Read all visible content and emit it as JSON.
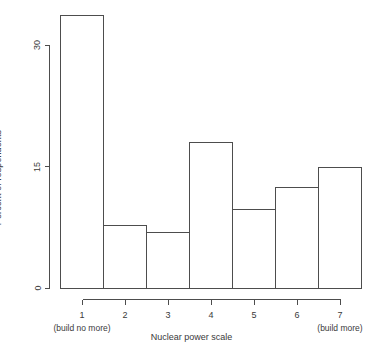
{
  "chart_data": {
    "type": "bar",
    "title": "",
    "subtitle": "",
    "xlabel": "Nuclear power scale",
    "ylabel": "Percent of respondents",
    "categories": [
      "1",
      "2",
      "3",
      "4",
      "5",
      "6",
      "7"
    ],
    "values": [
      33.7,
      7.8,
      6.9,
      18.0,
      9.8,
      12.5,
      15.0
    ],
    "xlim": [
      0.5,
      7.5
    ],
    "ylim": [
      0,
      33.7
    ],
    "yticks": [
      0,
      15,
      30
    ],
    "ytick_labels": [
      "0",
      "15",
      "30"
    ],
    "xticks": [
      1,
      2,
      3,
      4,
      5,
      6,
      7
    ],
    "xtick_labels": [
      "1",
      "2",
      "3",
      "4",
      "5",
      "6",
      "7"
    ],
    "x_anchor_labels": [
      {
        "tick": "1",
        "text": "(build no more)"
      },
      {
        "tick": "7",
        "text": "(build more)"
      }
    ],
    "grid": false,
    "legend": null,
    "bar_fill": "#ffffff",
    "bar_stroke": "#4d4d4d",
    "axis_color": "#4d4d4d",
    "text_color": "#3a3a3a",
    "background": "#ffffff"
  },
  "axes": {
    "ylabel_text": "Percent of respondents",
    "xlabel_text": "Nuclear power scale"
  },
  "y_ticks": [
    {
      "label": "30",
      "value": 30
    },
    {
      "label": "15",
      "value": 15
    },
    {
      "label": "0",
      "value": 0
    }
  ],
  "x_ticks": [
    {
      "label": "1",
      "sub": "(build no more)"
    },
    {
      "label": "2",
      "sub": ""
    },
    {
      "label": "3",
      "sub": ""
    },
    {
      "label": "4",
      "sub": ""
    },
    {
      "label": "5",
      "sub": ""
    },
    {
      "label": "6",
      "sub": ""
    },
    {
      "label": "7",
      "sub": "(build more)"
    }
  ]
}
